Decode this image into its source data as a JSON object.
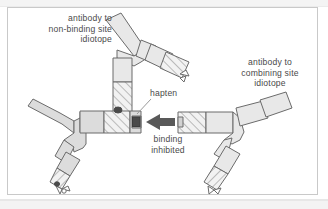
{
  "figure": {
    "labels": {
      "non_binding_idiotope": "antibody to\nnon-binding site\nidiotope",
      "combining_idiotope": "antibody to\ncombining site\nidiotope",
      "hapten": "hapten",
      "binding_inhibited": "binding\ninhibited"
    },
    "colors": {
      "frame_border": "#c9c9c9",
      "outline": "#6b6b6b",
      "antibody_fill": "#dcdcdc",
      "antibody_fill_light": "#e8e8e8",
      "hatch_fill": "#f2f2f2",
      "hatch_line": "#8c8c8c",
      "hapten_dark": "#4a4a4a",
      "arrow": "#595959",
      "leader_line": "#9a9a9a",
      "text": "#4a4a4a",
      "page_background": "#ffffff",
      "band_gray": "#f3f3f3"
    },
    "elements": {
      "antibody_left": "antibody to non-binding site idiotope (left Y, arms up-left and down, bound to central antibody)",
      "antibody_top": "antibody to combining site idiotope (top Y, stem descending to central combining site)",
      "antibody_center": "central antibody shown horizontally with combining site at right",
      "antibody_right": "hapten-blocked antibody approaching from the right",
      "hapten_marker": "small dark square occupying the combining site",
      "arrow_binding_inhibited": "leftward arrow indicating blocked binding"
    }
  }
}
